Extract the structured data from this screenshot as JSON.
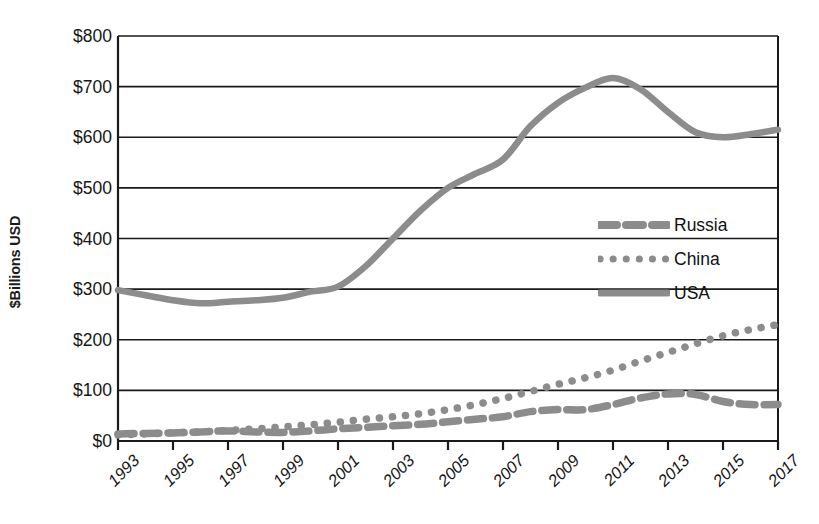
{
  "chart_data": {
    "type": "line",
    "title": "",
    "subtitle": "",
    "xlabel": "",
    "ylabel": "$Billions USD",
    "ylim": [
      0,
      800
    ],
    "ytick_step": 100,
    "ytick_labels": [
      "$800",
      "$700",
      "$600",
      "$500",
      "$400",
      "$300",
      "$200",
      "$100",
      "$0"
    ],
    "ytick_values": [
      800,
      700,
      600,
      500,
      400,
      300,
      200,
      100,
      0
    ],
    "grid": "horizontal",
    "legend_position": "center-right",
    "x": [
      1993,
      1994,
      1995,
      1996,
      1997,
      1998,
      1999,
      2000,
      2001,
      2002,
      2003,
      2004,
      2005,
      2006,
      2007,
      2008,
      2009,
      2010,
      2011,
      2012,
      2013,
      2014,
      2015,
      2016,
      2017
    ],
    "xtick_labels": [
      "1993",
      "1995",
      "1997",
      "1999",
      "2001",
      "2003",
      "2005",
      "2007",
      "2009",
      "2011",
      "2013",
      "2015",
      "2017"
    ],
    "xtick_values": [
      1993,
      1995,
      1997,
      1999,
      2001,
      2003,
      2005,
      2007,
      2009,
      2011,
      2013,
      2015,
      2017
    ],
    "xlim": [
      1993,
      2017
    ],
    "series": [
      {
        "name": "Russia",
        "style": "dashed",
        "color": "#8c8c8c",
        "values": [
          14,
          15,
          16,
          18,
          20,
          18,
          17,
          20,
          24,
          27,
          30,
          33,
          38,
          43,
          48,
          58,
          62,
          62,
          72,
          85,
          93,
          92,
          78,
          72,
          72
        ]
      },
      {
        "name": "China",
        "style": "dotted",
        "color": "#8c8c8c",
        "values": [
          12,
          14,
          16,
          18,
          21,
          24,
          28,
          32,
          37,
          43,
          48,
          54,
          62,
          72,
          84,
          98,
          112,
          125,
          140,
          158,
          175,
          192,
          208,
          220,
          230
        ]
      },
      {
        "name": "USA",
        "style": "solid",
        "color": "#8c8c8c",
        "values": [
          298,
          288,
          278,
          272,
          275,
          278,
          283,
          295,
          305,
          345,
          400,
          455,
          500,
          528,
          556,
          622,
          668,
          698,
          717,
          695,
          650,
          610,
          600,
          606,
          615
        ]
      }
    ]
  },
  "legend": {
    "entries": [
      {
        "label": "Russia",
        "swatch": "dashed-line-swatch"
      },
      {
        "label": "China",
        "swatch": "dotted-line-swatch"
      },
      {
        "label": "USA",
        "swatch": "solid-line-swatch"
      }
    ]
  },
  "axes": {
    "y_title": "$Billions USD"
  }
}
